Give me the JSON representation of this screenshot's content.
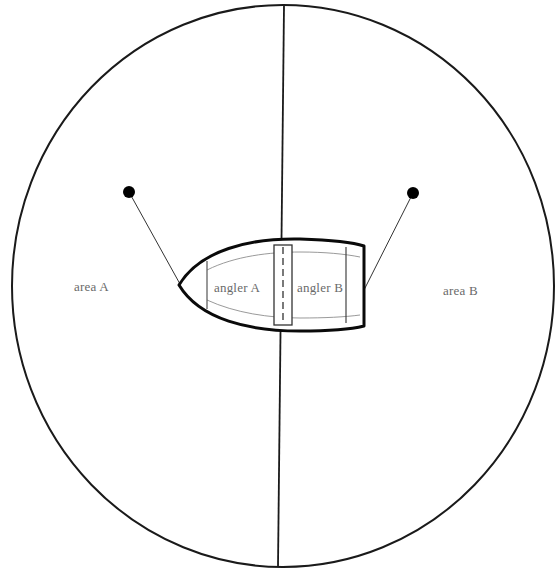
{
  "diagram": {
    "areas": [
      {
        "id": "area-a",
        "label": "area A"
      },
      {
        "id": "area-b",
        "label": "area B"
      }
    ],
    "anglers": [
      {
        "id": "angler-a",
        "label": "angler A"
      },
      {
        "id": "angler-b",
        "label": "angler B"
      }
    ],
    "colors": {
      "stroke": "#111111",
      "inner_stroke": "#9a9a9a",
      "label_text": "#6a6a6a",
      "background": "#ffffff"
    }
  }
}
